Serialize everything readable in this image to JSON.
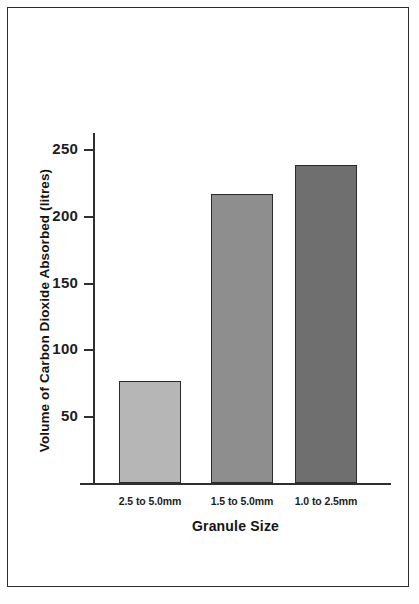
{
  "chart_data": {
    "type": "bar",
    "title": "",
    "subtitle": "",
    "xlabel": "Granule Size",
    "ylabel": "Volume of Carbon Dioxide Absorbed (litres)",
    "categories": [
      "2.5 to 5.0mm",
      "1.5 to 5.0mm",
      "1.0 to 2.5mm"
    ],
    "values": [
      76,
      216,
      238
    ],
    "bar_colors": [
      "#b6b6b6",
      "#8e8e8e",
      "#6f6f6f"
    ],
    "ylim": [
      0,
      262
    ],
    "yticks": [
      50,
      100,
      150,
      200,
      250
    ],
    "ytick_labels": [
      "50",
      "100",
      "150",
      "200",
      "250"
    ],
    "grid": false,
    "legend": false,
    "legend_position": "none",
    "axis_color": "#2f2f2f",
    "frame": true
  },
  "figure": {
    "background": "#ffffff",
    "border_color": "#2b2b2b"
  }
}
